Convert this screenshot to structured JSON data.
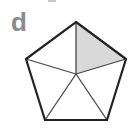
{
  "panel": {
    "label": "d"
  },
  "figure": {
    "shape": "regular-pentagon",
    "divided_into": 5,
    "shaded_sections": 1,
    "colors": {
      "stroke": "#222222",
      "inner_stroke": "#444444",
      "shade_fill": "#d9d9d9",
      "label": "#8a8a8a"
    }
  }
}
